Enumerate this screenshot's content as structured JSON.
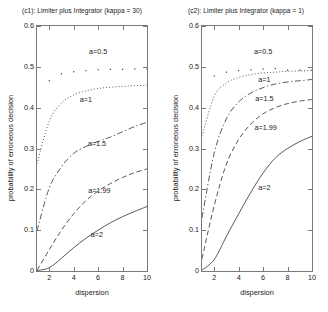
{
  "figure": {
    "width": 328,
    "height": 312,
    "background": "#ffffff",
    "line_color": "#3a3a3a",
    "axis_color": "#7a7a7a"
  },
  "chart_data": [
    {
      "type": "line",
      "panel_id": "c1",
      "title": "(c1): Limiter plus Integrator (kappa = 30)",
      "xlabel": "dispersion",
      "ylabel": "probability of erroneous decision",
      "xlim": [
        1,
        10
      ],
      "ylim": [
        0,
        0.6
      ],
      "xticks": [
        2,
        4,
        6,
        8,
        10
      ],
      "xticklabels": [
        "2",
        "4",
        "6",
        "8",
        "10"
      ],
      "yticks": [
        0,
        0.1,
        0.2,
        0.3,
        0.4,
        0.5,
        0.6
      ],
      "yticklabels": [
        "0",
        "0.1",
        "0.2",
        "0.3",
        "0.4",
        "0.5",
        "0.6"
      ],
      "grid": false,
      "legend": "inline-annotations",
      "x": [
        1,
        2,
        3,
        4,
        5,
        6,
        7,
        8,
        9,
        10
      ],
      "series": [
        {
          "name": "a=0.5",
          "style": "dotted-markers",
          "marker": "point",
          "values": [
            null,
            0.466,
            0.483,
            0.488,
            0.491,
            0.493,
            0.494,
            0.494,
            0.495,
            0.495
          ],
          "label_x": 6.0,
          "label_y": 0.537
        },
        {
          "name": "a=1",
          "style": "dotted",
          "values": [
            0.262,
            0.367,
            0.411,
            0.431,
            0.441,
            0.447,
            0.45,
            0.452,
            0.454,
            0.455
          ],
          "label_x": 5.0,
          "label_y": 0.418
        },
        {
          "name": "a=1.5",
          "style": "dash-dot",
          "values": [
            0.098,
            0.203,
            0.255,
            0.288,
            0.305,
            0.317,
            0.328,
            0.341,
            0.354,
            0.364
          ],
          "label_x": 5.9,
          "label_y": 0.31
        },
        {
          "name": "a=1.99",
          "style": "dashed",
          "values": [
            0.002,
            0.052,
            0.1,
            0.14,
            0.172,
            0.196,
            0.214,
            0.229,
            0.241,
            0.25
          ],
          "label_x": 6.1,
          "label_y": 0.196
        },
        {
          "name": "a=2",
          "style": "solid",
          "values": [
            0.001,
            0.008,
            0.031,
            0.057,
            0.08,
            0.1,
            0.118,
            0.133,
            0.146,
            0.158
          ],
          "label_x": 5.9,
          "label_y": 0.088
        }
      ]
    },
    {
      "type": "line",
      "panel_id": "c2",
      "title": "(c2): Limiter plus Integrator (kappa = 1)",
      "xlabel": "dispersion",
      "ylabel": "probability of erroneous decision",
      "xlim": [
        1,
        10
      ],
      "ylim": [
        0,
        0.6
      ],
      "xticks": [
        2,
        4,
        6,
        8,
        10
      ],
      "xticklabels": [
        "2",
        "4",
        "6",
        "8",
        "10"
      ],
      "yticks": [
        0,
        0.1,
        0.2,
        0.3,
        0.4,
        0.5,
        0.6
      ],
      "yticklabels": [
        "0",
        "0.1",
        "0.2",
        "0.3",
        "0.4",
        "0.5",
        "0.6"
      ],
      "grid": false,
      "legend": "inline-annotations",
      "x": [
        1,
        2,
        3,
        4,
        5,
        6,
        7,
        8,
        9,
        10
      ],
      "series": [
        {
          "name": "a=0.5",
          "style": "dotted-markers",
          "marker": "point",
          "values": [
            null,
            0.478,
            0.487,
            0.491,
            0.493,
            0.495,
            0.496,
            0.492,
            0.492,
            0.492
          ],
          "label_x": 6.0,
          "label_y": 0.537
        },
        {
          "name": "a=1",
          "style": "dotted",
          "values": [
            0.33,
            0.428,
            0.46,
            0.474,
            0.481,
            0.485,
            0.487,
            0.489,
            0.49,
            0.491
          ],
          "label_x": 6.1,
          "label_y": 0.468
        },
        {
          "name": "a=1.5",
          "style": "dash-dot",
          "values": [
            0.13,
            0.289,
            0.373,
            0.414,
            0.436,
            0.449,
            0.458,
            0.463,
            0.466,
            0.469
          ],
          "label_x": 6.1,
          "label_y": 0.422
        },
        {
          "name": "a=1.99",
          "style": "dashed",
          "values": [
            0.03,
            0.16,
            0.262,
            0.322,
            0.36,
            0.385,
            0.4,
            0.41,
            0.416,
            0.42
          ],
          "label_x": 6.2,
          "label_y": 0.35
        },
        {
          "name": "a=2",
          "style": "solid",
          "values": [
            0.002,
            0.028,
            0.085,
            0.14,
            0.193,
            0.24,
            0.277,
            0.3,
            0.317,
            0.33
          ],
          "label_x": 6.1,
          "label_y": 0.204
        }
      ]
    }
  ]
}
